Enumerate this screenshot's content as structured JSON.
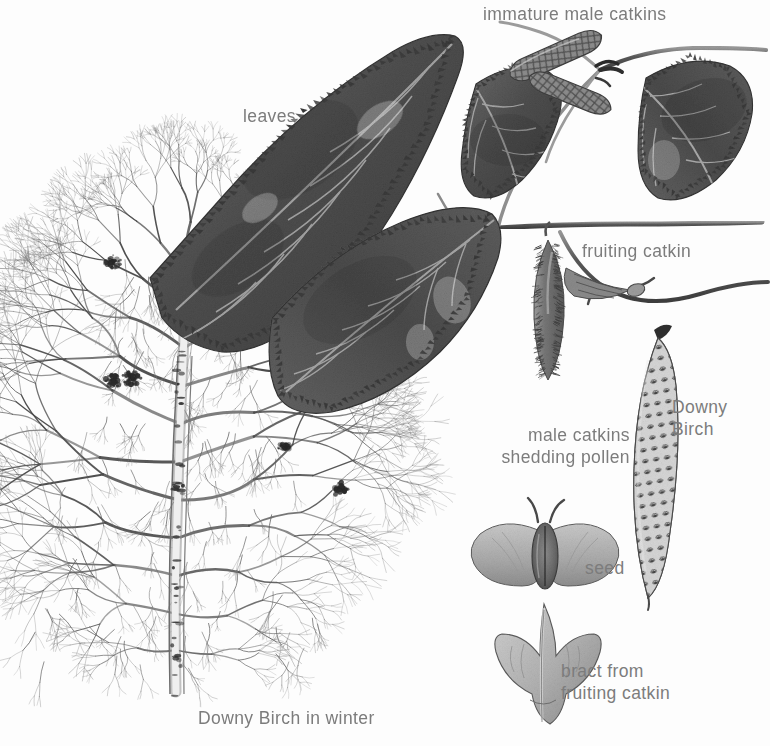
{
  "plate": {
    "title": "Downy Birch in winter",
    "subject": "Downy Birch",
    "medium": "graphite and wash botanical illustration",
    "background_color": "#fdfdfd",
    "ink_color": "#4a4a4a",
    "label_color": "#7c7c7c",
    "width": 770,
    "height": 746
  },
  "labels": {
    "immature_male_catkins": "immature male catkins",
    "leaves": "leaves",
    "fruiting_catkin": "fruiting catkin",
    "downy_birch": "Downy\nBirch",
    "male_catkins_shedding_pollen": "male catkins\nshedding pollen",
    "seed": "seed",
    "bract_from_fruiting_catkin": "bract from\nfruiting catkin",
    "downy_birch_in_winter": "Downy Birch in winter"
  },
  "label_positions": {
    "immature_male_catkins": {
      "x": 483,
      "y": 3
    },
    "leaves": {
      "x": 243,
      "y": 105
    },
    "fruiting_catkin": {
      "x": 582,
      "y": 240
    },
    "downy_birch": {
      "x": 672,
      "y": 396
    },
    "male_catkins_shedding_pollen": {
      "x": 530,
      "y": 424
    },
    "seed": {
      "x": 585,
      "y": 557
    },
    "bract_from_fruiting_catkin": {
      "x": 561,
      "y": 660
    },
    "downy_birch_in_winter": {
      "x": 198,
      "y": 707
    }
  },
  "specimens": [
    {
      "name": "winter-tree",
      "label": "Downy Birch in winter",
      "kind": "whole-tree-silhouette",
      "season": "winter",
      "features": [
        "fine pendulous twigs",
        "whitish trunk with dark markings",
        "witches-broom clusters"
      ]
    },
    {
      "name": "leaf-large-left",
      "label": "leaves",
      "kind": "leaf",
      "shape": "ovate, doubly serrate",
      "tone": "#585858"
    },
    {
      "name": "leaf-lower-left",
      "label": "leaves",
      "kind": "leaf",
      "shape": "ovate, doubly serrate",
      "tone": "#565656"
    },
    {
      "name": "leaf-small-centre",
      "label": "leaves",
      "kind": "leaf",
      "shape": "small ovate",
      "tone": "#5d5d5d"
    },
    {
      "name": "leaf-right",
      "label": "leaves",
      "kind": "leaf",
      "shape": "rounded ovate",
      "tone": "#5a5a5a"
    },
    {
      "name": "immature-male-catkin-upper",
      "label": "immature male catkins",
      "kind": "catkin",
      "state": "immature",
      "texture": "diamond lattice scales"
    },
    {
      "name": "immature-male-catkin-lower",
      "label": "immature male catkins",
      "kind": "catkin",
      "state": "immature",
      "texture": "diamond lattice scales"
    },
    {
      "name": "fruiting-catkin-hanging",
      "label": "fruiting catkin",
      "kind": "catkin",
      "state": "fruiting",
      "texture": "bristly"
    },
    {
      "name": "fruiting-catkin-small-right",
      "label": "fruiting catkin",
      "kind": "catkin",
      "state": "fruiting",
      "texture": "bristly"
    },
    {
      "name": "male-catkin-shedding",
      "label": "male catkins shedding pollen",
      "kind": "catkin",
      "state": "shedding pollen",
      "texture": "open knobbly scales"
    },
    {
      "name": "seed-nutlet",
      "label": "seed",
      "kind": "seed",
      "description": "winged nutlet with two styles"
    },
    {
      "name": "bract-trident",
      "label": "bract from fruiting catkin",
      "kind": "bract",
      "description": "three-lobed bract"
    }
  ],
  "chart_data": {
    "type": "table",
    "columns": [
      "part",
      "label"
    ],
    "rows": [
      [
        "whole tree in winter",
        "Downy Birch in winter"
      ],
      [
        "foliage",
        "leaves"
      ],
      [
        "young male inflorescence",
        "immature male catkins"
      ],
      [
        "female / fruiting inflorescence",
        "fruiting catkin"
      ],
      [
        "mature male inflorescence",
        "male catkins shedding pollen"
      ],
      [
        "winged nutlet",
        "seed"
      ],
      [
        "scale of fruiting catkin",
        "bract from fruiting catkin"
      ],
      [
        "species",
        "Downy Birch"
      ]
    ]
  }
}
